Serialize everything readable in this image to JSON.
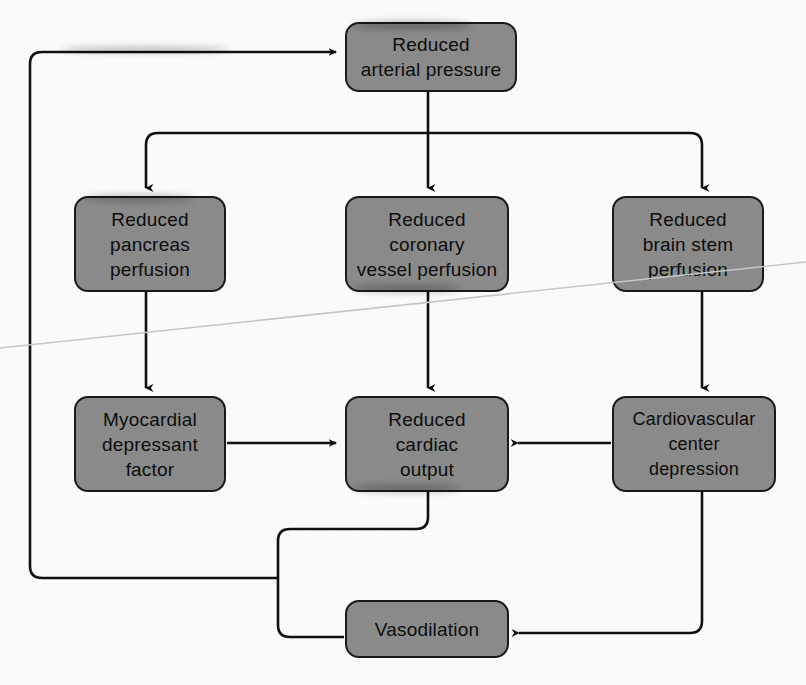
{
  "diagram": {
    "type": "flowchart",
    "canvas": {
      "width": 806,
      "height": 685
    },
    "colors": {
      "node_fill": "#8c8c8c",
      "node_border": "#1a1a1a",
      "connector": "#111111",
      "background": "#fdfdfb",
      "text": "#0d0d0d"
    },
    "nodes": [
      {
        "id": "reduced-arterial-pressure",
        "label": "Reduced\narterial pressure",
        "x": 345,
        "y": 22,
        "w": 172,
        "h": 70
      },
      {
        "id": "reduced-pancreas-perfusion",
        "label": "Reduced\npancreas\nperfusion",
        "x": 74,
        "y": 196,
        "w": 152,
        "h": 96
      },
      {
        "id": "reduced-coronary-vessel-perfusion",
        "label": "Reduced\ncoronary\nvessel perfusion",
        "x": 345,
        "y": 196,
        "w": 164,
        "h": 96
      },
      {
        "id": "reduced-brain-stem-perfusion",
        "label": "Reduced\nbrain stem\nperfusion",
        "x": 612,
        "y": 196,
        "w": 152,
        "h": 96
      },
      {
        "id": "myocardial-depressant-factor",
        "label": "Myocardial\ndepressant\nfactor",
        "x": 74,
        "y": 396,
        "w": 152,
        "h": 96
      },
      {
        "id": "reduced-cardiac-output",
        "label": "Reduced\ncardiac\noutput",
        "x": 345,
        "y": 396,
        "w": 164,
        "h": 96
      },
      {
        "id": "cardiovascular-center-depression",
        "label": "Cardiovascular\ncenter\ndepression",
        "x": 612,
        "y": 396,
        "w": 164,
        "h": 96
      },
      {
        "id": "vasodilation",
        "label": "Vasodilation",
        "x": 345,
        "y": 600,
        "w": 164,
        "h": 58
      }
    ],
    "edges": [
      {
        "id": "edge-arterial-to-bus",
        "from": "reduced-arterial-pressure",
        "to": "distribution-bus",
        "arrow": false
      },
      {
        "id": "edge-bus-to-pancreas",
        "from": "distribution-bus",
        "to": "reduced-pancreas-perfusion",
        "arrow": true
      },
      {
        "id": "edge-bus-to-coronary",
        "from": "distribution-bus",
        "to": "reduced-coronary-vessel-perfusion",
        "arrow": true
      },
      {
        "id": "edge-bus-to-brain-stem",
        "from": "distribution-bus",
        "to": "reduced-brain-stem-perfusion",
        "arrow": true
      },
      {
        "id": "edge-pancreas-to-myocardial",
        "from": "reduced-pancreas-perfusion",
        "to": "myocardial-depressant-factor",
        "arrow": true
      },
      {
        "id": "edge-coronary-to-cardiac-output",
        "from": "reduced-coronary-vessel-perfusion",
        "to": "reduced-cardiac-output",
        "arrow": true
      },
      {
        "id": "edge-brain-stem-to-cv-center",
        "from": "reduced-brain-stem-perfusion",
        "to": "cardiovascular-center-depression",
        "arrow": true
      },
      {
        "id": "edge-myocardial-to-cardiac-output",
        "from": "myocardial-depressant-factor",
        "to": "reduced-cardiac-output",
        "arrow": true
      },
      {
        "id": "edge-cv-center-to-cardiac-output",
        "from": "cardiovascular-center-depression",
        "to": "reduced-cardiac-output",
        "arrow": true
      },
      {
        "id": "edge-cv-center-to-vasodilation",
        "from": "cardiovascular-center-depression",
        "to": "vasodilation",
        "arrow": true
      },
      {
        "id": "edge-cardiac-output-to-vasodilation-junction",
        "from": "reduced-cardiac-output",
        "to": "vasodilation",
        "arrow": false
      },
      {
        "id": "edge-feedback-to-arterial-pressure",
        "from": "vasodilation-junction",
        "to": "reduced-arterial-pressure",
        "arrow": true
      }
    ]
  }
}
